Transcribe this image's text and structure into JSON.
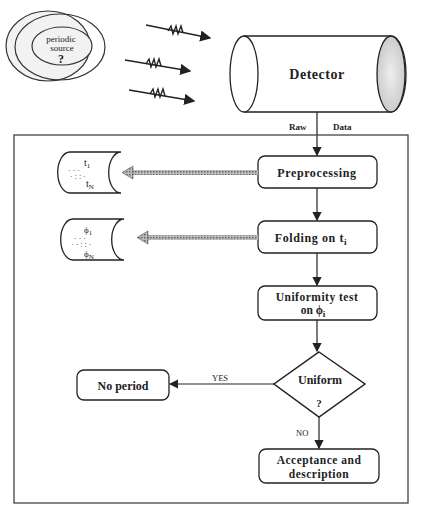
{
  "diagram": {
    "type": "flowchart",
    "source": {
      "line1": "periodic",
      "line2": "source",
      "mark": "?"
    },
    "detector": {
      "label": "Detector"
    },
    "raw_data": {
      "left": "Raw",
      "right": "Data"
    },
    "steps": {
      "preprocessing": "Preprocessing",
      "folding": "Folding on t",
      "folding_sub": "i",
      "uniformity_l1": "Uniformity  test",
      "uniformity_l2": "on  ϕ",
      "uniformity_sub": "i",
      "decision_l1": "Uniform",
      "decision_l2": "?",
      "no_period": "No  period",
      "accept_l1": "Acceptance  and",
      "accept_l2": "description"
    },
    "edges": {
      "yes": "YES",
      "no": "NO"
    },
    "stores": {
      "times": {
        "first": "t",
        "first_sub": "1",
        "last": "t",
        "last_sub": "N"
      },
      "phases": {
        "first": "ϕ",
        "first_sub": "1",
        "last": "ϕ",
        "last_sub": "N"
      }
    }
  }
}
